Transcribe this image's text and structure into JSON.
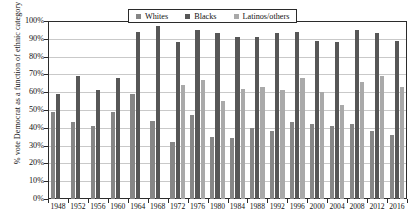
{
  "chart_data": {
    "type": "bar",
    "title": "",
    "xlabel": "",
    "ylabel": "% vote Democrat as a function of ethnic category",
    "ylim": [
      0,
      100
    ],
    "ytick_labels": [
      "100%",
      "90%",
      "80%",
      "70%",
      "60%",
      "50%",
      "40%",
      "30%",
      "20%",
      "10%",
      "0%"
    ],
    "ytick_values": [
      100,
      90,
      80,
      70,
      60,
      50,
      40,
      30,
      20,
      10,
      0
    ],
    "grid": true,
    "legend_position": "top-center",
    "categories": [
      "1948",
      "1952",
      "1956",
      "1960",
      "1964",
      "1968",
      "1972",
      "1976",
      "1980",
      "1984",
      "1988",
      "1992",
      "1996",
      "2000",
      "2004",
      "2008",
      "2012",
      "2016"
    ],
    "series": [
      {
        "name": "Whites",
        "color": "#868686",
        "values": [
          49,
          43,
          41,
          49,
          59,
          44,
          32,
          47,
          35,
          34,
          40,
          38,
          43,
          42,
          41,
          42,
          38,
          36
        ]
      },
      {
        "name": "Blacks",
        "color": "#575757",
        "values": [
          59,
          69,
          61,
          68,
          94,
          97,
          88,
          95,
          93,
          91,
          91,
          93,
          94,
          89,
          88,
          95,
          93,
          89
        ]
      },
      {
        "name": "Latinos/others",
        "color": "#a9a9a9",
        "values": [
          null,
          null,
          null,
          null,
          null,
          null,
          64,
          67,
          55,
          62,
          63,
          61,
          68,
          60,
          53,
          66,
          69,
          63
        ]
      }
    ]
  },
  "legend": {
    "items": [
      {
        "label": "Whites",
        "color": "#868686"
      },
      {
        "label": "Blacks",
        "color": "#575757"
      },
      {
        "label": "Latinos/others",
        "color": "#a9a9a9"
      }
    ]
  }
}
